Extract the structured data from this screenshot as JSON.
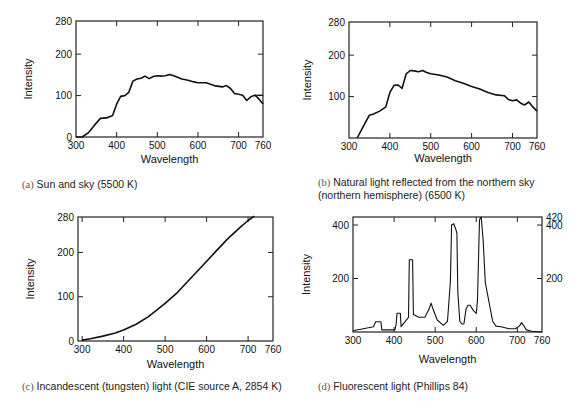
{
  "figure": {
    "panels": [
      {
        "id": "a",
        "caption_tag": "(a)",
        "caption": "Sun and sky (5500 K)",
        "xlabel": "Wavelength",
        "ylabel": "Intensity"
      },
      {
        "id": "b",
        "caption_tag": "(b)",
        "caption": "Natural light reflected from the northern sky (northern hemisphere) (6500 K)",
        "xlabel": "Wavelength",
        "ylabel": "Intensity"
      },
      {
        "id": "c",
        "caption_tag": "(c)",
        "caption": "Incandescent (tungsten) light (CIE source A, 2854 K)",
        "xlabel": "Wavelength",
        "ylabel": "Intensity"
      },
      {
        "id": "d",
        "caption_tag": "(d)",
        "caption": "Fluorescent light (Phillips 84)",
        "xlabel": "Wavelength",
        "ylabel": "Intensity"
      }
    ]
  },
  "chart_data": [
    {
      "type": "line",
      "title": "(a) Sun and sky (5500 K)",
      "xlabel": "Wavelength",
      "ylabel": "Intensity",
      "xlim": [
        300,
        760
      ],
      "ylim": [
        0,
        280
      ],
      "xticks": [
        300,
        400,
        500,
        600,
        700,
        760
      ],
      "yticks": [
        0,
        100,
        200,
        280
      ],
      "grid": false,
      "legend": null,
      "x": [
        300,
        315,
        330,
        345,
        360,
        375,
        390,
        400,
        410,
        420,
        430,
        440,
        450,
        460,
        470,
        480,
        490,
        500,
        510,
        520,
        530,
        540,
        550,
        560,
        570,
        580,
        590,
        600,
        620,
        640,
        660,
        670,
        680,
        690,
        700,
        710,
        720,
        730,
        740,
        750,
        760
      ],
      "y": [
        0,
        0,
        10,
        28,
        45,
        46,
        52,
        80,
        98,
        100,
        108,
        135,
        140,
        142,
        147,
        141,
        146,
        148,
        147,
        148,
        151,
        148,
        144,
        140,
        138,
        136,
        133,
        131,
        131,
        124,
        121,
        124,
        117,
        105,
        103,
        101,
        88,
        97,
        101,
        92,
        80
      ],
      "series_extra": {
        "name": "reference line",
        "x": [
          740,
          760
        ],
        "y": [
          101,
          101
        ]
      }
    },
    {
      "type": "line",
      "title": "(b) Natural light reflected from the northern sky (northern hemisphere) (6500 K)",
      "xlabel": "Wavelength",
      "ylabel": "Intensity",
      "xlim": [
        300,
        760
      ],
      "ylim": [
        0,
        280
      ],
      "xticks": [
        300,
        400,
        500,
        600,
        700,
        760
      ],
      "yticks": [
        100,
        200,
        280
      ],
      "grid": false,
      "legend": null,
      "x": [
        320,
        335,
        350,
        360,
        375,
        390,
        400,
        410,
        420,
        430,
        440,
        450,
        460,
        470,
        480,
        490,
        500,
        520,
        540,
        560,
        580,
        600,
        620,
        640,
        660,
        680,
        690,
        700,
        710,
        720,
        730,
        740,
        750,
        760
      ],
      "y": [
        0,
        28,
        55,
        58,
        65,
        75,
        110,
        127,
        128,
        120,
        155,
        163,
        162,
        160,
        163,
        158,
        155,
        152,
        147,
        138,
        132,
        124,
        118,
        110,
        104,
        102,
        93,
        90,
        92,
        84,
        80,
        87,
        75,
        65
      ]
    },
    {
      "type": "line",
      "title": "(c) Incandescent (tungsten) light (CIE source A, 2854 K)",
      "xlabel": "Wavelength",
      "ylabel": "Intensity",
      "xlim": [
        290,
        760
      ],
      "ylim": [
        0,
        280
      ],
      "xticks": [
        300,
        400,
        500,
        600,
        700,
        760
      ],
      "yticks": [
        0,
        100,
        200,
        280
      ],
      "grid": false,
      "legend": null,
      "x": [
        300,
        320,
        350,
        380,
        400,
        430,
        460,
        500,
        530,
        560,
        590,
        620,
        650,
        680,
        700,
        715
      ],
      "y": [
        2,
        5,
        11,
        18,
        25,
        38,
        55,
        85,
        110,
        140,
        170,
        200,
        230,
        256,
        272,
        282
      ]
    },
    {
      "type": "line",
      "title": "(d) Fluorescent light (Phillips 84)",
      "xlabel": "Wavelength",
      "ylabel": "Intensity",
      "xlim": [
        300,
        760
      ],
      "ylim": [
        0,
        430
      ],
      "xticks": [
        300,
        400,
        500,
        600,
        700,
        760
      ],
      "yticks_left": [
        200,
        400
      ],
      "yticks_right": [
        200,
        400,
        420
      ],
      "grid": false,
      "legend": null,
      "x": [
        300,
        350,
        355,
        362,
        368,
        370,
        402,
        405,
        407,
        415,
        417,
        435,
        437,
        445,
        447,
        460,
        475,
        485,
        490,
        495,
        505,
        520,
        530,
        537,
        540,
        545,
        550,
        553,
        555,
        560,
        565,
        570,
        575,
        580,
        585,
        593,
        600,
        603,
        608,
        612,
        617,
        622,
        630,
        640,
        648,
        660,
        680,
        695,
        705,
        710,
        715,
        722,
        735,
        760
      ],
      "y": [
        5,
        20,
        38,
        38,
        38,
        8,
        8,
        28,
        70,
        70,
        20,
        55,
        270,
        270,
        65,
        55,
        55,
        85,
        108,
        85,
        45,
        25,
        40,
        190,
        400,
        405,
        385,
        370,
        150,
        40,
        30,
        30,
        85,
        100,
        100,
        80,
        70,
        120,
        420,
        430,
        340,
        185,
        120,
        40,
        22,
        20,
        12,
        12,
        22,
        35,
        25,
        8,
        3,
        0
      ]
    }
  ]
}
